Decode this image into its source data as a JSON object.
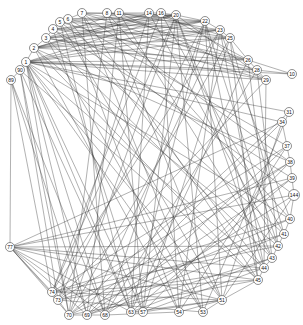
{
  "diagram": {
    "type": "circular-network-graph",
    "nodes": [
      {
        "id": "7",
        "x": 82,
        "y": 13
      },
      {
        "id": "8",
        "x": 107,
        "y": 13
      },
      {
        "id": "11",
        "x": 119,
        "y": 13
      },
      {
        "id": "14",
        "x": 149,
        "y": 13
      },
      {
        "id": "16",
        "x": 161,
        "y": 13
      },
      {
        "id": "20",
        "x": 176,
        "y": 15
      },
      {
        "id": "22",
        "x": 205,
        "y": 21
      },
      {
        "id": "23",
        "x": 220,
        "y": 30
      },
      {
        "id": "25",
        "x": 230,
        "y": 38
      },
      {
        "id": "26",
        "x": 248,
        "y": 60
      },
      {
        "id": "28",
        "x": 257,
        "y": 70
      },
      {
        "id": "29",
        "x": 266,
        "y": 80
      },
      {
        "id": "10",
        "x": 292,
        "y": 74
      },
      {
        "id": "31",
        "x": 289,
        "y": 112
      },
      {
        "id": "34",
        "x": 282,
        "y": 122
      },
      {
        "id": "37",
        "x": 287,
        "y": 146
      },
      {
        "id": "38",
        "x": 290,
        "y": 162
      },
      {
        "id": "39",
        "x": 292,
        "y": 178
      },
      {
        "id": "144",
        "x": 294,
        "y": 195
      },
      {
        "id": "40",
        "x": 290,
        "y": 219
      },
      {
        "id": "41",
        "x": 284,
        "y": 234
      },
      {
        "id": "42",
        "x": 278,
        "y": 246
      },
      {
        "id": "43",
        "x": 272,
        "y": 258
      },
      {
        "id": "44",
        "x": 264,
        "y": 268
      },
      {
        "id": "45",
        "x": 258,
        "y": 280
      },
      {
        "id": "51",
        "x": 222,
        "y": 300
      },
      {
        "id": "53",
        "x": 203,
        "y": 312
      },
      {
        "id": "54",
        "x": 179,
        "y": 312
      },
      {
        "id": "57",
        "x": 143,
        "y": 312
      },
      {
        "id": "63",
        "x": 131,
        "y": 312
      },
      {
        "id": "68",
        "x": 105,
        "y": 315
      },
      {
        "id": "69",
        "x": 87,
        "y": 315
      },
      {
        "id": "70",
        "x": 69,
        "y": 315
      },
      {
        "id": "73",
        "x": 58,
        "y": 300
      },
      {
        "id": "74",
        "x": 52,
        "y": 292
      },
      {
        "id": "77",
        "x": 10,
        "y": 247
      },
      {
        "id": "89",
        "x": 11,
        "y": 80
      },
      {
        "id": "90",
        "x": 20,
        "y": 70
      },
      {
        "id": "1",
        "x": 26,
        "y": 62
      },
      {
        "id": "2",
        "x": 34,
        "y": 48
      },
      {
        "id": "3",
        "x": 46,
        "y": 38
      },
      {
        "id": "4",
        "x": 53,
        "y": 29
      },
      {
        "id": "5",
        "x": 60,
        "y": 22
      },
      {
        "id": "6",
        "x": 68,
        "y": 19
      }
    ],
    "edges": [
      [
        "1",
        "20"
      ],
      [
        "1",
        "22"
      ],
      [
        "1",
        "23"
      ],
      [
        "1",
        "25"
      ],
      [
        "1",
        "26"
      ],
      [
        "1",
        "28"
      ],
      [
        "1",
        "29"
      ],
      [
        "1",
        "31"
      ],
      [
        "1",
        "34"
      ],
      [
        "1",
        "40"
      ],
      [
        "1",
        "44"
      ],
      [
        "1",
        "51"
      ],
      [
        "1",
        "53"
      ],
      [
        "1",
        "63"
      ],
      [
        "1",
        "57"
      ],
      [
        "1",
        "68"
      ],
      [
        "1",
        "69"
      ],
      [
        "1",
        "70"
      ],
      [
        "1",
        "10"
      ],
      [
        "2",
        "20"
      ],
      [
        "2",
        "22"
      ],
      [
        "2",
        "23"
      ],
      [
        "2",
        "25"
      ],
      [
        "2",
        "26"
      ],
      [
        "2",
        "38"
      ],
      [
        "2",
        "42"
      ],
      [
        "2",
        "45"
      ],
      [
        "2",
        "54"
      ],
      [
        "2",
        "16"
      ],
      [
        "2",
        "14"
      ],
      [
        "3",
        "20"
      ],
      [
        "3",
        "22"
      ],
      [
        "3",
        "23"
      ],
      [
        "3",
        "28"
      ],
      [
        "3",
        "29"
      ],
      [
        "3",
        "43"
      ],
      [
        "3",
        "53"
      ],
      [
        "3",
        "11"
      ],
      [
        "4",
        "20"
      ],
      [
        "4",
        "22"
      ],
      [
        "4",
        "25"
      ],
      [
        "4",
        "26"
      ],
      [
        "4",
        "39"
      ],
      [
        "4",
        "41"
      ],
      [
        "4",
        "57"
      ],
      [
        "5",
        "20"
      ],
      [
        "5",
        "23"
      ],
      [
        "5",
        "29"
      ],
      [
        "5",
        "144"
      ],
      [
        "5",
        "51"
      ],
      [
        "5",
        "63"
      ],
      [
        "6",
        "20"
      ],
      [
        "6",
        "22"
      ],
      [
        "6",
        "26"
      ],
      [
        "6",
        "37"
      ],
      [
        "6",
        "44"
      ],
      [
        "6",
        "54"
      ],
      [
        "7",
        "20"
      ],
      [
        "7",
        "25"
      ],
      [
        "7",
        "28"
      ],
      [
        "7",
        "38"
      ],
      [
        "7",
        "45"
      ],
      [
        "7",
        "53"
      ],
      [
        "7",
        "68"
      ],
      [
        "8",
        "22"
      ],
      [
        "8",
        "26"
      ],
      [
        "8",
        "40"
      ],
      [
        "8",
        "51"
      ],
      [
        "8",
        "70"
      ],
      [
        "11",
        "23"
      ],
      [
        "11",
        "29"
      ],
      [
        "11",
        "43"
      ],
      [
        "11",
        "57"
      ],
      [
        "11",
        "69"
      ],
      [
        "14",
        "25"
      ],
      [
        "14",
        "42"
      ],
      [
        "14",
        "63"
      ],
      [
        "14",
        "73"
      ],
      [
        "16",
        "26"
      ],
      [
        "16",
        "41"
      ],
      [
        "16",
        "54"
      ],
      [
        "16",
        "74"
      ],
      [
        "20",
        "29"
      ],
      [
        "20",
        "44"
      ],
      [
        "20",
        "53"
      ],
      [
        "20",
        "57"
      ],
      [
        "20",
        "70"
      ],
      [
        "20",
        "74"
      ],
      [
        "20",
        "43"
      ],
      [
        "22",
        "45"
      ],
      [
        "22",
        "51"
      ],
      [
        "22",
        "63"
      ],
      [
        "22",
        "68"
      ],
      [
        "22",
        "73"
      ],
      [
        "22",
        "42"
      ],
      [
        "23",
        "40"
      ],
      [
        "23",
        "54"
      ],
      [
        "23",
        "69"
      ],
      [
        "23",
        "74"
      ],
      [
        "23",
        "44"
      ],
      [
        "25",
        "41"
      ],
      [
        "25",
        "57"
      ],
      [
        "25",
        "70"
      ],
      [
        "25",
        "45"
      ],
      [
        "26",
        "10"
      ],
      [
        "26",
        "43"
      ],
      [
        "26",
        "63"
      ],
      [
        "28",
        "10"
      ],
      [
        "28",
        "42"
      ],
      [
        "28",
        "68"
      ],
      [
        "29",
        "44"
      ],
      [
        "29",
        "73"
      ],
      [
        "31",
        "53"
      ],
      [
        "31",
        "70"
      ],
      [
        "34",
        "51"
      ],
      [
        "34",
        "69"
      ],
      [
        "34",
        "77"
      ],
      [
        "37",
        "54"
      ],
      [
        "37",
        "74"
      ],
      [
        "37",
        "68"
      ],
      [
        "38",
        "57"
      ],
      [
        "38",
        "73"
      ],
      [
        "38",
        "70"
      ],
      [
        "39",
        "63"
      ],
      [
        "39",
        "69"
      ],
      [
        "39",
        "77"
      ],
      [
        "144",
        "77"
      ],
      [
        "144",
        "68"
      ],
      [
        "144",
        "51"
      ],
      [
        "40",
        "74"
      ],
      [
        "40",
        "70"
      ],
      [
        "41",
        "73"
      ],
      [
        "41",
        "69"
      ],
      [
        "42",
        "77"
      ],
      [
        "42",
        "74"
      ],
      [
        "43",
        "69"
      ],
      [
        "43",
        "63"
      ],
      [
        "44",
        "73"
      ],
      [
        "44",
        "57"
      ],
      [
        "45",
        "51"
      ],
      [
        "45",
        "74"
      ],
      [
        "45",
        "70"
      ],
      [
        "51",
        "53"
      ],
      [
        "51",
        "54"
      ],
      [
        "51",
        "57"
      ],
      [
        "51",
        "63"
      ],
      [
        "51",
        "74"
      ],
      [
        "51",
        "77"
      ],
      [
        "53",
        "73"
      ],
      [
        "54",
        "68"
      ],
      [
        "57",
        "63"
      ],
      [
        "68",
        "69"
      ],
      [
        "69",
        "70"
      ],
      [
        "70",
        "73"
      ],
      [
        "73",
        "74"
      ],
      [
        "77",
        "89"
      ],
      [
        "77",
        "73"
      ],
      [
        "77",
        "74"
      ],
      [
        "77",
        "70"
      ],
      [
        "77",
        "69"
      ],
      [
        "77",
        "68"
      ],
      [
        "77",
        "63"
      ],
      [
        "77",
        "45"
      ],
      [
        "77",
        "44"
      ],
      [
        "89",
        "90"
      ],
      [
        "90",
        "1"
      ],
      [
        "89",
        "68"
      ],
      [
        "89",
        "69"
      ],
      [
        "89",
        "74"
      ],
      [
        "90",
        "73"
      ],
      [
        "90",
        "70"
      ],
      [
        "90",
        "63"
      ],
      [
        "90",
        "45"
      ],
      [
        "1",
        "2"
      ],
      [
        "2",
        "3"
      ],
      [
        "3",
        "4"
      ],
      [
        "4",
        "5"
      ],
      [
        "5",
        "6"
      ],
      [
        "6",
        "7"
      ],
      [
        "7",
        "8"
      ],
      [
        "8",
        "11"
      ],
      [
        "11",
        "14"
      ],
      [
        "14",
        "16"
      ],
      [
        "16",
        "20"
      ],
      [
        "20",
        "22"
      ],
      [
        "22",
        "23"
      ],
      [
        "23",
        "25"
      ],
      [
        "25",
        "26"
      ],
      [
        "26",
        "28"
      ],
      [
        "28",
        "29"
      ],
      [
        "34",
        "37"
      ],
      [
        "37",
        "38"
      ],
      [
        "38",
        "39"
      ],
      [
        "39",
        "144"
      ],
      [
        "144",
        "40"
      ],
      [
        "40",
        "41"
      ],
      [
        "41",
        "42"
      ],
      [
        "42",
        "43"
      ],
      [
        "43",
        "44"
      ],
      [
        "44",
        "45"
      ]
    ]
  }
}
